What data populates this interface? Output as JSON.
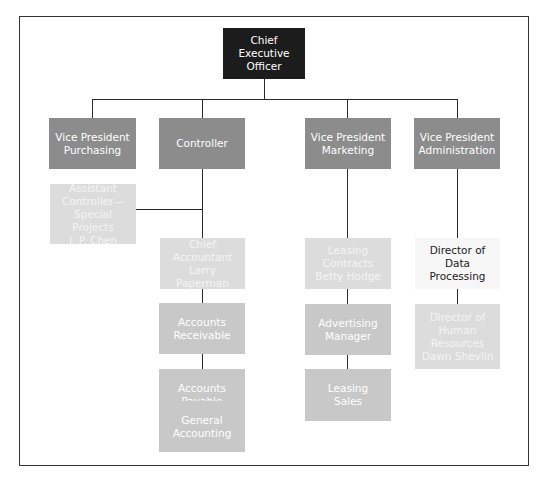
{
  "chart": {
    "type": "org-chart",
    "nodes": {
      "ceo": "Chief Executive\nOfficer",
      "vp_purchasing": "Vice President\nPurchasing",
      "controller": "Controller",
      "vp_marketing": "Vice President\nMarketing",
      "vp_admin": "Vice President\nAdministration",
      "asst_controller": "Assistant\nController—\nSpecial Projects\nJ. P. Chen",
      "chief_accountant": "Chief\nAccountant\nLarry Paperman",
      "accounts_receivable": "Accounts\nReceivable",
      "accounts_payable": "Accounts\nPayable",
      "general_accounting": "General\nAccounting",
      "leasing_contracts": "Leasing\nContracts\nBetty Hodge",
      "advertising_manager": "Advertising\nManager",
      "leasing_sales": "Leasing\nSales",
      "director_data_processing": "Director of\nData\nProcessing",
      "director_hr": "Director of\nHuman\nResources\nDawn Shevlin"
    },
    "colors": {
      "dark": "#1c1c1c",
      "mid": "#8c8c8c",
      "light": "#c8c8c8",
      "pale": "#dcdcdc",
      "white": "#f6f6f6"
    }
  }
}
